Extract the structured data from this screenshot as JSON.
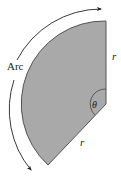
{
  "diagram": {
    "type": "circular-sector",
    "labels": {
      "arc": "Arc",
      "radius_top": "r",
      "radius_bottom": "r",
      "angle": "θ"
    },
    "colors": {
      "sector_fill": "#a9a9a9",
      "sector_stroke": "#555555",
      "arrow": "#222222",
      "text": "#222222"
    }
  }
}
